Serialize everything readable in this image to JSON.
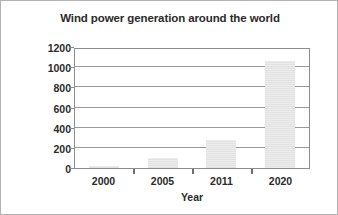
{
  "chart_data": {
    "type": "bar",
    "title": "Wind power generation around the world",
    "xlabel": "Year",
    "ylabel": "Gigawatts",
    "categories": [
      "2000",
      "2005",
      "2011",
      "2020"
    ],
    "values": [
      17,
      100,
      280,
      1060
    ],
    "ylim": [
      0,
      1200
    ],
    "yticks": [
      0,
      200,
      400,
      600,
      800,
      1000,
      1200
    ],
    "ytick_labels": [
      "0",
      "200",
      "400",
      "600",
      "800",
      "1000",
      "1200"
    ],
    "grid": "horizontal",
    "legend": null,
    "colors": {
      "bar_fill": "#e9e9e9",
      "axis": "#8c8c8c",
      "gridline": "#9a9a9a",
      "text": "#2b2b2b",
      "background": "#ffffff",
      "border": "#b3b3b3"
    }
  }
}
